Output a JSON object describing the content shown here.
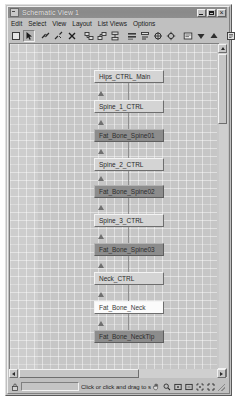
{
  "window": {
    "title": "Schematic View 1",
    "sysmenu_icon": "system-menu-icon",
    "buttons": [
      {
        "name": "minimize-button",
        "label": "_"
      },
      {
        "name": "maximize-button",
        "label": "□"
      },
      {
        "name": "close-button",
        "label": "×"
      }
    ]
  },
  "menubar": {
    "items": [
      {
        "label": "Edit"
      },
      {
        "label": "Select"
      },
      {
        "label": "View"
      },
      {
        "label": "Layout"
      },
      {
        "label": "List Views"
      },
      {
        "label": "Options"
      }
    ]
  },
  "toolbar": {
    "tools": [
      {
        "name": "display-floater-icon",
        "pressed": false
      },
      {
        "name": "select-arrow-icon",
        "pressed": true
      },
      {
        "name": "connect-link-icon",
        "pressed": false
      },
      {
        "name": "unlink-icon",
        "pressed": false
      },
      {
        "name": "delete-object-icon",
        "pressed": false
      },
      {
        "name": "expand-selected-icon",
        "pressed": false
      },
      {
        "name": "collapse-selected-icon",
        "pressed": false
      },
      {
        "name": "expand-all-icon",
        "pressed": false
      },
      {
        "name": "align-horizontal-icon",
        "pressed": false
      },
      {
        "name": "align-vertical-icon",
        "pressed": false
      },
      {
        "name": "free-all-icon",
        "pressed": false
      },
      {
        "name": "free-selected-icon",
        "pressed": false
      },
      {
        "name": "always-arrange-icon",
        "pressed": false
      },
      {
        "name": "shrink-selected-icon",
        "pressed": false
      },
      {
        "name": "expand-node-icon",
        "pressed": false
      },
      {
        "name": "preferences-icon",
        "pressed": false
      },
      {
        "name": "display-properties-icon",
        "pressed": false
      }
    ]
  },
  "canvas": {
    "nodes": [
      {
        "name": "node-hips-ctrl-main",
        "label": "Hips_CTRL_Main",
        "style": "light",
        "x": 84,
        "y": 26,
        "w": 70
      },
      {
        "name": "node-spine-1-ctrl",
        "label": "Spine_1_CTRL",
        "style": "light",
        "x": 84,
        "y": 56,
        "w": 70
      },
      {
        "name": "node-fat-bone-spine01",
        "label": "Fat_Bone_Spine01",
        "style": "dark",
        "x": 84,
        "y": 85,
        "w": 70
      },
      {
        "name": "node-spine-2-ctrl",
        "label": "Spine_2_CTRL",
        "style": "light",
        "x": 84,
        "y": 114,
        "w": 70
      },
      {
        "name": "node-fat-bone-spine02",
        "label": "Fat_Bone_Spine02",
        "style": "dark",
        "x": 84,
        "y": 141,
        "w": 70
      },
      {
        "name": "node-spine-3-ctrl",
        "label": "Spine_3_CTRL",
        "style": "light",
        "x": 84,
        "y": 170,
        "w": 70
      },
      {
        "name": "node-fat-bone-spine03",
        "label": "Fat_Bone_Spine03",
        "style": "dark",
        "x": 84,
        "y": 199,
        "w": 70
      },
      {
        "name": "node-neck-ctrl",
        "label": "Neck_CTRL",
        "style": "light",
        "x": 84,
        "y": 228,
        "w": 70
      },
      {
        "name": "node-fat-bone-neck",
        "label": "Fat_Bone_Neck",
        "style": "white",
        "x": 84,
        "y": 257,
        "w": 70
      },
      {
        "name": "node-fat-bone-necktip",
        "label": "Fat_Bone_NeckTip",
        "style": "dark",
        "x": 84,
        "y": 286,
        "w": 70
      }
    ]
  },
  "scrollbars": {
    "vertical": {
      "name": "vertical-scrollbar",
      "up": "scroll-up-arrow-icon",
      "down": "scroll-down-arrow-icon"
    },
    "horizontal": {
      "name": "horizontal-scrollbar",
      "left": "scroll-left-arrow-icon",
      "right": "scroll-right-arrow-icon"
    }
  },
  "statusbar": {
    "lock_icon": "selection-lock-icon",
    "field_value": "",
    "hint": "Click or click and drag to select",
    "tools": [
      {
        "name": "pan-hand-icon"
      },
      {
        "name": "zoom-magnifier-icon"
      },
      {
        "name": "zoom-region-icon"
      },
      {
        "name": "zoom-extents-icon"
      },
      {
        "name": "zoom-extents-selected-icon"
      },
      {
        "name": "maximize-viewport-icon"
      }
    ],
    "grip": "resize-grip-icon"
  },
  "colors": {
    "window_face": "#c0c0c0",
    "titlebar": "#8c8c8c",
    "canvas": "#c6c6c6",
    "node_light": "#d4d4d4",
    "node_dark": "#8c8c8c",
    "node_white": "#fbfbfb",
    "edge": "#8f8f8f"
  }
}
